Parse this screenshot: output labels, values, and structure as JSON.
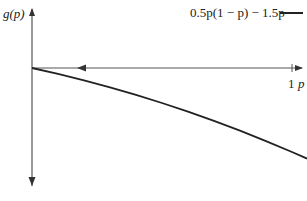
{
  "chart_data": {
    "type": "line",
    "title": "",
    "xlabel": "p",
    "ylabel": "g(p)",
    "x_ticks": [
      {
        "value": 1,
        "label": "1"
      }
    ],
    "xlim": [
      0,
      1.06
    ],
    "ylim": [
      -2.1,
      1.1
    ],
    "grid": false,
    "legend_position": "top-right",
    "annotations": [
      "left-pointing arrow on p-axis near p=0.18"
    ],
    "series": [
      {
        "name": "0.5p(1 − p) − 1.5p",
        "color": "#222222",
        "x": [
          0,
          0.1,
          0.2,
          0.3,
          0.4,
          0.5,
          0.6,
          0.7,
          0.8,
          0.9,
          1.0,
          1.058
        ],
        "y": [
          0,
          -0.105,
          -0.22,
          -0.345,
          -0.48,
          -0.625,
          -0.78,
          -0.945,
          -1.12,
          -1.305,
          -1.5,
          -1.618
        ]
      }
    ]
  },
  "labels": {
    "y_axis": "g(p)",
    "x_axis": "p",
    "x_tick_1": "1",
    "legend": "0.5p(1 − p) − 1.5p"
  }
}
